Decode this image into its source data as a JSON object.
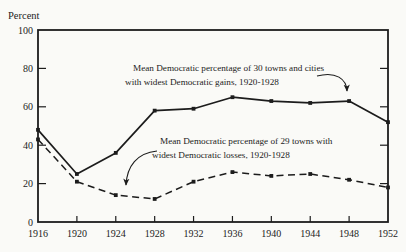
{
  "page": {
    "paper_color": "#fafaf7",
    "ink_color": "#1c1c1c"
  },
  "chart_data": {
    "type": "line",
    "title": "",
    "xlabel": "",
    "ylabel": "Percent",
    "ylim": [
      0,
      100
    ],
    "y_ticks": [
      0,
      20,
      40,
      60,
      80,
      100
    ],
    "x": [
      1916,
      1920,
      1924,
      1928,
      1932,
      1936,
      1940,
      1944,
      1948,
      1952
    ],
    "grid": false,
    "legend_position": "inline-annotations-with-arrows",
    "series": [
      {
        "name": "democratic-gains-towns",
        "line_style": "solid",
        "marker": "square",
        "annotation_line1": "Mean Democratic percentage of 30 towns and cities",
        "annotation_line2": "with widest Democratic gains, 1920-1928",
        "values": [
          48,
          25,
          36,
          58,
          59,
          65,
          63,
          62,
          63,
          52
        ]
      },
      {
        "name": "democratic-losses-towns",
        "line_style": "dashed",
        "marker": "square",
        "annotation_line1": "Mean Democratic percentage of 29 towns with",
        "annotation_line2": "widest Democratic losses, 1920-1928",
        "values": [
          43,
          21,
          14,
          12,
          21,
          26,
          24,
          25,
          22,
          18
        ]
      }
    ]
  }
}
